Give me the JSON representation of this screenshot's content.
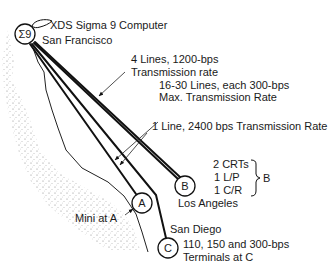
{
  "diagram": {
    "hub": {
      "symbol": "Σ9",
      "label_computer": "XDS Sigma 9 Computer",
      "label_city": "San Francisco"
    },
    "nodes": {
      "A": {
        "symbol": "A",
        "annotation": "Mini at A"
      },
      "B": {
        "symbol": "B",
        "city": "Los Angeles"
      },
      "C": {
        "symbol": "C",
        "city": "San Diego",
        "note_line1": "110, 150 and 300-bps",
        "note_line2": "Terminals at C"
      }
    },
    "links": [
      {
        "id": "link-1",
        "label_line1": "4 Lines, 1200-bps",
        "label_line2": "Transmission rate"
      },
      {
        "id": "link-2",
        "label_line1": "16-30 Lines, each 300-bps",
        "label_line2": "Max. Transmission Rate"
      },
      {
        "id": "link-3",
        "label_line1": "1 Line, 2400 bps Transmission Rate"
      }
    ],
    "equipment_at_B": {
      "items": [
        "2 CRTs",
        "1 L/P",
        "1 C/R"
      ],
      "brace_label": "B"
    }
  }
}
